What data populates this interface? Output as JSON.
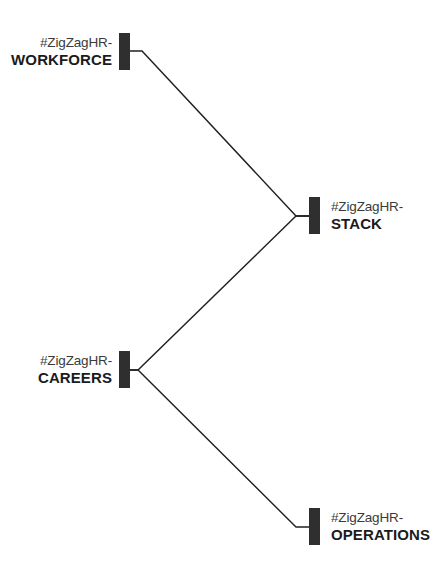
{
  "diagram": {
    "background_color": "#ffffff",
    "node_color": "#2f2f2f",
    "line_color": "#231f20",
    "nodes": [
      {
        "id": "workforce",
        "prefix": "#ZigZagHR-",
        "name": "WORKFORCE",
        "side": "left",
        "bar_x": 119,
        "bar_y": 33,
        "anchor_x": 130,
        "anchor_y": 51
      },
      {
        "id": "stack",
        "prefix": "#ZigZagHR-",
        "name": "STACK",
        "side": "right",
        "bar_x": 309,
        "bar_y": 197,
        "anchor_x": 309,
        "anchor_y": 216
      },
      {
        "id": "careers",
        "prefix": "#ZigZagHR-",
        "name": "CAREERS",
        "side": "left",
        "bar_x": 119,
        "bar_y": 351,
        "anchor_x": 130,
        "anchor_y": 370
      },
      {
        "id": "operations",
        "prefix": "#ZigZagHR-",
        "name": "OPERATIONS",
        "side": "right",
        "bar_x": 309,
        "bar_y": 508,
        "anchor_x": 309,
        "anchor_y": 527
      }
    ],
    "edges": [
      {
        "id": "workforce-to-stack",
        "from": "workforce",
        "to": "stack",
        "points": "130,51 142,51 296,216 309,216"
      },
      {
        "id": "careers-to-stack",
        "from": "careers",
        "to": "stack",
        "points": "130,370 138,370 296,216 309,216"
      },
      {
        "id": "careers-to-operations",
        "from": "careers",
        "to": "operations",
        "points": "130,370 138,370 296,527 309,527"
      }
    ]
  }
}
